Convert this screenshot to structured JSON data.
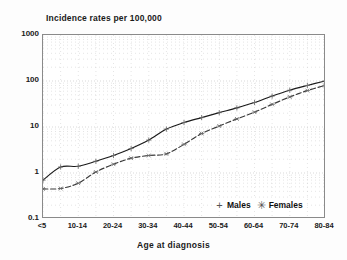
{
  "chart_data": {
    "type": "line",
    "title": "Incidence rates per 100,000",
    "xlabel": "Age at diagnosis",
    "ylabel": "",
    "scale": "log",
    "ylim": [
      0.1,
      1000
    ],
    "ytick_labels": [
      "1000",
      "100",
      "10",
      "1",
      "0.1"
    ],
    "ytick_values": [
      1000,
      100,
      10,
      1,
      0.1
    ],
    "grid": true,
    "legend_position": "bottom-right",
    "categories": [
      "<5",
      "5-9",
      "10-14",
      "15-19",
      "20-24",
      "25-29",
      "30-34",
      "35-39",
      "40-44",
      "45-49",
      "50-54",
      "55-59",
      "60-64",
      "65-69",
      "70-74",
      "75-79",
      "80-84"
    ],
    "xtick_labels": [
      "<5",
      "",
      "10-14",
      "",
      "20-24",
      "",
      "30-34",
      "",
      "40-44",
      "",
      "50-54",
      "",
      "60-64",
      "",
      "70-74",
      "",
      "80-84"
    ],
    "series": [
      {
        "name": "Males",
        "marker": "plus",
        "linestyle": "solid",
        "color": "#1a1a1a",
        "values": [
          0.7,
          1.35,
          1.4,
          1.8,
          2.4,
          3.4,
          5.2,
          9.0,
          12.5,
          16.0,
          20.5,
          26.0,
          34.0,
          47.0,
          63.0,
          80.0,
          100.0
        ]
      },
      {
        "name": "Females",
        "marker": "asterisk",
        "linestyle": "dashed",
        "color": "#3a3a3a",
        "values": [
          0.45,
          0.46,
          0.6,
          1.05,
          1.55,
          2.1,
          2.4,
          2.6,
          4.2,
          7.2,
          10.5,
          15.0,
          21.0,
          31.0,
          45.0,
          62.0,
          80.0
        ]
      }
    ]
  },
  "legend": {
    "males_label": "Males",
    "females_label": "Females",
    "males_marker": "+",
    "females_marker": "✳"
  }
}
